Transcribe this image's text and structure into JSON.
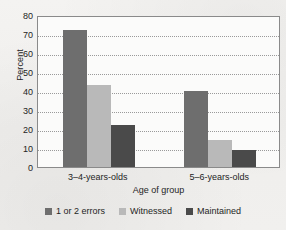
{
  "chart_data": {
    "type": "bar",
    "title": "",
    "xlabel": "Age of group",
    "ylabel": "Percent",
    "categories": [
      "3–4-years-olds",
      "5–6-years-olds"
    ],
    "series": [
      {
        "name": "1 or 2 errors",
        "color": "#6e6e6e",
        "values": [
          72,
          40
        ]
      },
      {
        "name": "Witnessed",
        "color": "#b9b9b9",
        "values": [
          43,
          14
        ]
      },
      {
        "name": "Maintained",
        "color": "#4a4a4a",
        "values": [
          22,
          9
        ]
      }
    ],
    "ylim": [
      0,
      80
    ],
    "yticks": [
      80,
      70,
      60,
      50,
      40,
      30,
      20,
      10,
      0
    ],
    "grid": true,
    "grid_style": "dotted-horizontal",
    "legend_position": "bottom"
  },
  "legend": {
    "items": [
      {
        "label": "1 or 2 errors",
        "color": "#6e6e6e"
      },
      {
        "label": "Witnessed",
        "color": "#b9b9b9"
      },
      {
        "label": "Maintained",
        "color": "#4a4a4a"
      }
    ]
  }
}
